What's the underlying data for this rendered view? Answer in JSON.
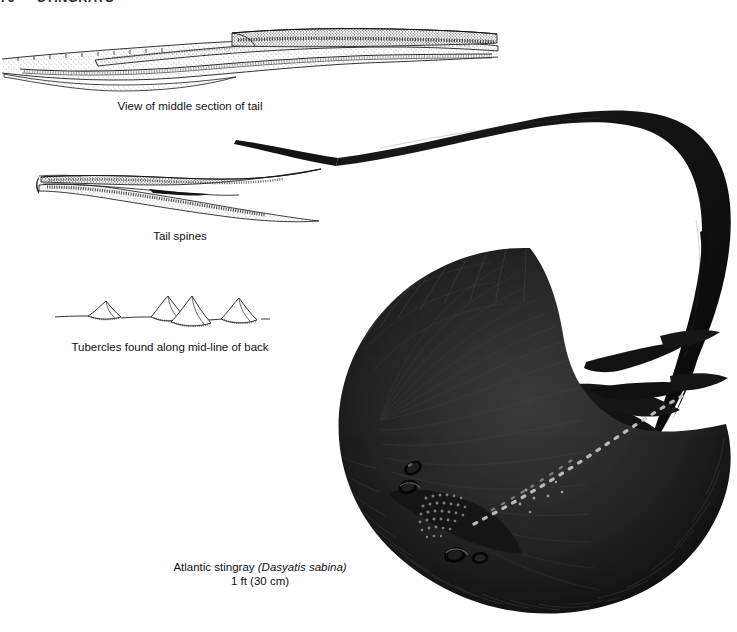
{
  "page": {
    "width": 737,
    "height": 632,
    "background": "#ffffff",
    "ink": "#111111"
  },
  "running_head": {
    "folio": "76",
    "section": "STINGRAYS"
  },
  "figures": [
    {
      "id": "tail-middle-section",
      "caption": "View of middle section of tail",
      "style": "pen-and-ink line drawing with stipple shading",
      "subject": "dorsal tail section showing overlapping spine sheath"
    },
    {
      "id": "tail-spines",
      "caption": "Tail spines",
      "style": "pen-and-ink line drawing with stipple shading",
      "subject": "two serrated venomous tail barbs"
    },
    {
      "id": "tubercles",
      "caption": "Tubercles found along mid-line of back",
      "style": "pen-and-ink outline drawing",
      "subject": "row of four pointed dermal tubercles on a baseline",
      "count": 4
    },
    {
      "id": "atlantic-stingray",
      "caption_common": "Atlantic stingray",
      "caption_scientific": "(Dasyatis sabina)",
      "caption_size": "1 ft (30 cm)",
      "style": "halftone photographic plate, dark silhouette",
      "subject": "whole Atlantic stingray, dorsal view, long whip tail curving up and to the right",
      "ink": "#141414"
    }
  ],
  "captions": {
    "tail_middle": "View of middle section of tail",
    "tail_spines": "Tail spines",
    "tubercles": "Tubercles found along mid-line of back",
    "species_common": "Atlantic stingray ",
    "species_scientific": "(Dasyatis sabina)",
    "species_size": "1 ft (30 cm)"
  }
}
